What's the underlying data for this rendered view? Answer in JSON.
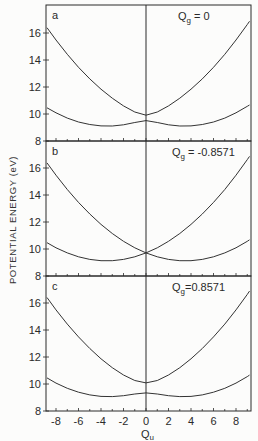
{
  "chart_data": {
    "type": "line",
    "title": "",
    "xlabel": "Q",
    "xlabel_subscript": "u",
    "ylabel": "POTENTIAL ENERGY (eV)",
    "xlim": [
      -8.89,
      9.33
    ],
    "ylim": [
      8,
      18
    ],
    "x_ticks": [
      -8,
      -6,
      -4,
      -2,
      0,
      2,
      4,
      6,
      8
    ],
    "y_ticks": [
      8,
      10,
      12,
      14,
      16
    ],
    "grid": false,
    "legend": null,
    "x": [
      -8.8,
      -8,
      -7,
      -6,
      -5,
      -4,
      -3,
      -2,
      -1,
      0,
      1,
      2,
      3,
      4,
      5,
      6,
      7,
      8,
      9,
      9.2
    ],
    "panels": [
      {
        "label": "a",
        "annotation": {
          "symbol": "Q",
          "subscript": "g",
          "value": " = 0"
        },
        "series": [
          {
            "name": "upper",
            "values": [
              16.39,
              15.48,
              14.42,
              13.46,
              12.6,
              11.84,
              11.17,
              10.6,
              10.15,
              9.91,
              10.15,
              10.6,
              11.17,
              11.84,
              12.6,
              13.46,
              14.42,
              15.48,
              16.63,
              16.87
            ]
          },
          {
            "name": "lower",
            "values": [
              10.46,
              10.09,
              9.7,
              9.41,
              9.22,
              9.12,
              9.11,
              9.2,
              9.37,
              9.51,
              9.37,
              9.2,
              9.11,
              9.12,
              9.22,
              9.41,
              9.7,
              10.09,
              10.57,
              10.67
            ]
          }
        ]
      },
      {
        "label": "b",
        "annotation": {
          "symbol": "Q",
          "subscript": "g",
          "value": " = -0.8571"
        },
        "series": [
          {
            "name": "upper",
            "values": [
              16.38,
              15.47,
              14.41,
              13.45,
              12.59,
              11.82,
              11.15,
              10.57,
              10.09,
              9.71,
              10.09,
              10.57,
              11.15,
              11.82,
              12.59,
              13.45,
              14.41,
              15.47,
              16.62,
              16.86
            ]
          },
          {
            "name": "lower",
            "values": [
              10.47,
              10.09,
              9.71,
              9.42,
              9.23,
              9.13,
              9.13,
              9.23,
              9.42,
              9.71,
              9.42,
              9.23,
              9.13,
              9.13,
              9.23,
              9.42,
              9.71,
              10.09,
              10.57,
              10.68
            ]
          }
        ]
      },
      {
        "label": "c",
        "annotation": {
          "symbol": "Q",
          "subscript": "g",
          "value": "=0.8571"
        },
        "series": [
          {
            "name": "upper",
            "values": [
              16.41,
              15.49,
              14.44,
              13.49,
              12.63,
              11.87,
              11.21,
              10.67,
              10.26,
              10.08,
              10.26,
              10.67,
              11.21,
              11.87,
              12.63,
              13.49,
              14.44,
              15.49,
              16.64,
              16.88
            ]
          },
          {
            "name": "lower",
            "values": [
              10.45,
              10.07,
              9.68,
              9.39,
              9.19,
              9.08,
              9.07,
              9.13,
              9.26,
              9.34,
              9.26,
              9.13,
              9.07,
              9.08,
              9.19,
              9.39,
              9.68,
              10.07,
              10.55,
              10.66
            ]
          }
        ]
      }
    ]
  },
  "colors": {
    "line": "#333333",
    "axis": "#2a2a2a",
    "background": "#fcfcfb"
  }
}
